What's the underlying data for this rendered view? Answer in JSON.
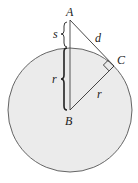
{
  "diagram": {
    "type": "geometry",
    "colors": {
      "circle_fill": "#ebebeb",
      "circle_stroke": "#555555",
      "line": "#333333",
      "background": "#ffffff"
    },
    "points": {
      "A": {
        "label": "A",
        "x": 70,
        "y": 20
      },
      "B": {
        "label": "B",
        "x": 70,
        "y": 110
      },
      "C": {
        "label": "C",
        "x": 114,
        "y": 66
      }
    },
    "circle": {
      "center": "B",
      "cx": 70,
      "cy": 110,
      "r": 62
    },
    "segments": [
      {
        "from": "A",
        "to": "B",
        "label": ""
      },
      {
        "from": "A",
        "to": "C",
        "label": "d"
      },
      {
        "from": "B",
        "to": "C",
        "label": "r"
      }
    ],
    "braces": [
      {
        "label": "s",
        "span": "A to circle top"
      },
      {
        "label": "r",
        "span": "circle top to B"
      }
    ],
    "right_angle_at": "C",
    "labels": {
      "A": "A",
      "B": "B",
      "C": "C",
      "d": "d",
      "s": "s",
      "r_brace": "r",
      "r_radius": "r"
    }
  }
}
